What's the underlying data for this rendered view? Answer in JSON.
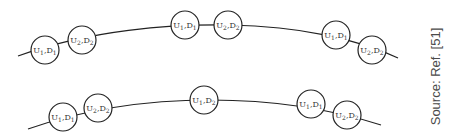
{
  "diagram": {
    "rows": [
      {
        "id": "top-row",
        "nodes": [
          {
            "u": "U",
            "u_sub": "1",
            "d": "D",
            "d_sub": "1",
            "cx": 45,
            "cy": 50
          },
          {
            "u": "U",
            "u_sub": "2",
            "d": "D",
            "d_sub": "2",
            "cx": 82,
            "cy": 40
          },
          {
            "u": "U",
            "u_sub": "1",
            "d": "D",
            "d_sub": "1",
            "cx": 185,
            "cy": 25
          },
          {
            "u": "U",
            "u_sub": "2",
            "d": "D",
            "d_sub": "2",
            "cx": 228,
            "cy": 25
          },
          {
            "u": "U",
            "u_sub": "1",
            "d": "D",
            "d_sub": "1",
            "cx": 336,
            "cy": 35
          },
          {
            "u": "U",
            "u_sub": "2",
            "d": "D",
            "d_sub": "2",
            "cx": 372,
            "cy": 50
          }
        ]
      },
      {
        "id": "bottom-row",
        "nodes": [
          {
            "u": "U",
            "u_sub": "1",
            "d": "D",
            "d_sub": "1",
            "cx": 63,
            "cy": 117
          },
          {
            "u": "U",
            "u_sub": "2",
            "d": "D",
            "d_sub": "2",
            "cx": 98,
            "cy": 108
          },
          {
            "u": "U",
            "u_sub": "1",
            "d": "D",
            "d_sub": "2",
            "cx": 204,
            "cy": 100
          },
          {
            "u": "U",
            "u_sub": "1",
            "d": "D",
            "d_sub": "1",
            "cx": 311,
            "cy": 104
          },
          {
            "u": "U",
            "u_sub": "2",
            "d": "D",
            "d_sub": "2",
            "cx": 347,
            "cy": 115
          }
        ]
      }
    ],
    "source_note": "Source: Ref. [51]"
  }
}
